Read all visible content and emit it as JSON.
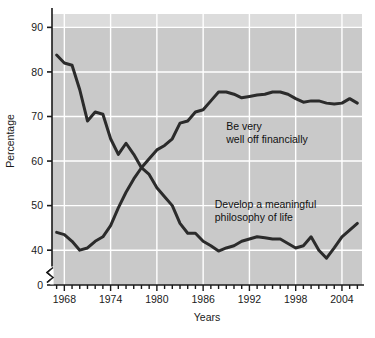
{
  "chart_data": {
    "type": "line",
    "title": "",
    "subtitle": "",
    "xlabel": "Years",
    "ylabel": "Percentage",
    "xlim": [
      1966.4,
      2006.6
    ],
    "ylim": [
      0,
      93
    ],
    "y_axis_break": true,
    "y_axis_break_note": "axis broken between 0 and ~36",
    "grid": true,
    "grid_color": "#ffffff",
    "plot_background": "#c9c9c9",
    "legend_position": "inline-annotations",
    "xticks": [
      1968,
      1974,
      1980,
      1986,
      1992,
      1998,
      2004
    ],
    "xtick_labels": [
      "1968",
      "1974",
      "1980",
      "1986",
      "1992",
      "1998",
      "2004"
    ],
    "x_minor_ticks": [
      1967,
      1968,
      1969,
      1970,
      1971,
      1972,
      1973,
      1974,
      1975,
      1976,
      1977,
      1978,
      1979,
      1980,
      1981,
      1982,
      1983,
      1984,
      1985,
      1986,
      1987,
      1988,
      1989,
      1990,
      1991,
      1992,
      1993,
      1994,
      1995,
      1996,
      1997,
      1998,
      1999,
      2000,
      2001,
      2002,
      2003,
      2004,
      2005,
      2006
    ],
    "yticks": [
      0,
      40,
      50,
      60,
      70,
      80,
      90
    ],
    "ytick_labels": [
      "0",
      "40",
      "50",
      "60",
      "70",
      "80",
      "90"
    ],
    "series": [
      {
        "name": "Be very well off financially",
        "color": "#2b2b2b",
        "line_width": 3,
        "annotation": [
          "Be very",
          "well off financially"
        ],
        "annotation_x": 1989.0,
        "annotation_y": 67.0,
        "x": [
          1967,
          1968,
          1969,
          1970,
          1971,
          1972,
          1973,
          1974,
          1975,
          1976,
          1977,
          1978,
          1979,
          1980,
          1981,
          1982,
          1983,
          1984,
          1985,
          1986,
          1987,
          1988,
          1989,
          1990,
          1991,
          1992,
          1993,
          1994,
          1995,
          1996,
          1997,
          1998,
          1999,
          2000,
          2001,
          2002,
          2003,
          2004,
          2005,
          2006
        ],
        "y": [
          44.0,
          43.5,
          42.0,
          40.0,
          40.5,
          42.0,
          43.0,
          45.5,
          49.5,
          53.0,
          56.0,
          58.5,
          60.5,
          62.5,
          63.5,
          65.0,
          68.5,
          69.0,
          71.0,
          71.5,
          73.5,
          75.5,
          75.5,
          75.0,
          74.2,
          74.5,
          74.8,
          75.0,
          75.5,
          75.5,
          75.0,
          74.0,
          73.2,
          73.5,
          73.5,
          73.0,
          72.8,
          73.0,
          74.0,
          73.0
        ]
      },
      {
        "name": "Develop a meaningful philosophy of life",
        "color": "#2b2b2b",
        "line_width": 3,
        "annotation": [
          "Develop a meaningful",
          "philosophy of life"
        ],
        "annotation_x": 1987.5,
        "annotation_y": 49.5,
        "x": [
          1967,
          1968,
          1969,
          1970,
          1971,
          1972,
          1973,
          1974,
          1975,
          1976,
          1977,
          1978,
          1979,
          1980,
          1981,
          1982,
          1983,
          1984,
          1985,
          1986,
          1987,
          1988,
          1989,
          1990,
          1991,
          1992,
          1993,
          1994,
          1995,
          1996,
          1997,
          1998,
          1999,
          2000,
          2001,
          2002,
          2003,
          2004,
          2005,
          2006
        ],
        "y": [
          83.8,
          82.0,
          81.5,
          76.0,
          69.0,
          71.0,
          70.5,
          65.0,
          61.5,
          64.0,
          61.5,
          58.5,
          57.0,
          54.0,
          52.0,
          50.0,
          46.0,
          43.8,
          43.8,
          42.0,
          41.0,
          39.8,
          40.5,
          41.0,
          42.0,
          42.5,
          43.0,
          42.8,
          42.5,
          42.5,
          41.5,
          40.5,
          41.0,
          43.0,
          40.0,
          38.2,
          40.5,
          43.0,
          44.5,
          46.0
        ]
      }
    ]
  }
}
